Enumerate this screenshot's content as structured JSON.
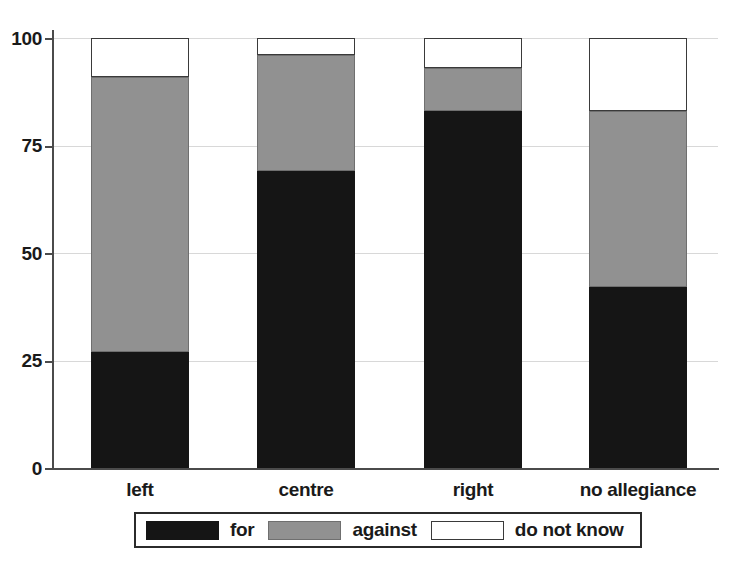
{
  "chart_data": {
    "type": "bar",
    "subtype": "stacked-bar-100",
    "title": "",
    "xlabel": "",
    "ylabel": "",
    "categories": [
      "left",
      "centre",
      "right",
      "no allegiance"
    ],
    "series": [
      {
        "name": "for",
        "color": "#151515",
        "values": [
          27,
          69,
          83,
          42
        ]
      },
      {
        "name": "against",
        "color": "#919191",
        "values": [
          64,
          27,
          10,
          41
        ]
      },
      {
        "name": "do not know",
        "color": "#ffffff",
        "values": [
          9,
          4,
          7,
          17
        ]
      }
    ],
    "cumulative_tops": {
      "for": [
        27,
        69,
        83,
        42
      ],
      "for_against": [
        91,
        96,
        93,
        83
      ],
      "total": [
        100,
        100,
        100,
        100
      ]
    },
    "ylim": [
      0,
      100
    ],
    "yticks": [
      0,
      25,
      50,
      75,
      100
    ],
    "ytick_labels": [
      "0",
      "25",
      "50",
      "75",
      "100"
    ],
    "grid": true,
    "grid_axis": "y",
    "legend_position": "bottom",
    "legend_entries": [
      "for",
      "against",
      "do not know"
    ]
  },
  "axes": {
    "y_tick_labels": [
      "100",
      "75",
      "50",
      "25",
      "0"
    ],
    "x_tick_labels": [
      "left",
      "centre",
      "right",
      "no allegiance"
    ]
  },
  "legend": {
    "items": [
      {
        "label": "for",
        "swatch": "black-swatch"
      },
      {
        "label": "against",
        "swatch": "gray-swatch"
      },
      {
        "label": "do not know",
        "swatch": "white-swatch"
      }
    ]
  },
  "colors": {
    "for": "#151515",
    "against": "#919191",
    "do_not_know": "#ffffff",
    "axis": "#4b4b4b",
    "grid": "#d8d8d8",
    "text": "#1a1a1a"
  }
}
